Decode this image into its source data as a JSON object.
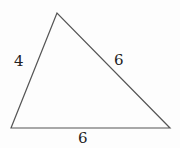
{
  "diagram": {
    "type": "triangle",
    "vertices": {
      "apex": [
        57,
        13
      ],
      "bottom_left": [
        11,
        128
      ],
      "bottom_right": [
        170,
        128
      ]
    },
    "sides": {
      "left": {
        "label": "4"
      },
      "right": {
        "label": "6"
      },
      "bottom": {
        "label": "6"
      }
    },
    "stroke_color": "#555555"
  }
}
